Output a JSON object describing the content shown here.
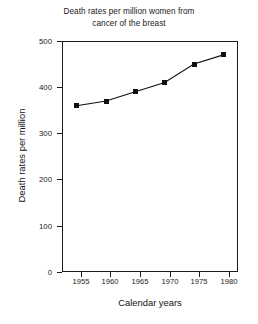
{
  "chart_data": {
    "type": "line",
    "title": "Death rates per million women from cancer of the breast",
    "title_lines": [
      "Death rates per million women from",
      "cancer of the breast"
    ],
    "xlabel": "Calendar years",
    "ylabel": "Death rates per million",
    "x": [
      1955,
      1960,
      1965,
      1970,
      1975,
      1980
    ],
    "values": [
      360,
      370,
      390,
      410,
      450,
      470
    ],
    "categories": [
      "1955",
      "1960",
      "1965",
      "1970",
      "1975",
      "1980"
    ],
    "xticks": [
      "1955",
      "1960",
      "1965",
      "1970",
      "1975",
      "1980"
    ],
    "yticks": [
      "0",
      "100",
      "200",
      "300",
      "400",
      "500"
    ],
    "xlim": [
      1952.5,
      1982.5
    ],
    "ylim": [
      0,
      500
    ],
    "grid": false,
    "legend": null,
    "marker": "filled-square",
    "series_color": "#101010"
  },
  "colors": {
    "background": "#ffffff",
    "axis": "#1c1c1c",
    "line": "#101010",
    "text": "#1a1a1a"
  }
}
